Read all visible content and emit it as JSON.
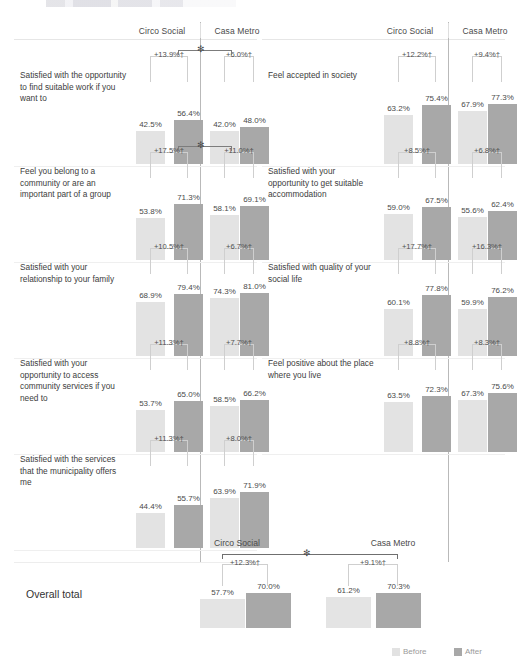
{
  "colors": {
    "before": "#e3e3e3",
    "after": "#a8a8a8",
    "separator": "#b9b9b9",
    "text": "#3d3d3d"
  },
  "legend": {
    "before_label": "Before",
    "after_label": "After"
  },
  "columns": {
    "left_group": "Circo Social",
    "right_group": "Casa Metro"
  },
  "total": {
    "label": "Overall total",
    "col1": "Circo Social",
    "col2": "Casa Metro",
    "marker": "✻"
  },
  "chart_data": {
    "type": "bar",
    "title": "",
    "xlabel": "",
    "ylabel": "",
    "ylim": [
      0,
      100
    ],
    "grid": false,
    "legend_position": "bottom-right",
    "series": [
      {
        "name": "Before",
        "color": "#e3e3e3"
      },
      {
        "name": "After",
        "color": "#a8a8a8"
      }
    ],
    "groups": [
      "Circo Social",
      "Casa Metro"
    ],
    "left_column": [
      {
        "category": "Satisfied with the opportunity to find suitable work if you want to",
        "circo": {
          "before": 42.5,
          "after": 56.4,
          "before_label": "42.5%",
          "after_label": "56.4%",
          "delta": "+13.9%†"
        },
        "casa": {
          "before": 42.0,
          "after": 48.0,
          "before_label": "42.0%",
          "after_label": "48.0%",
          "delta": "+6.0%†"
        },
        "group_compare": "✻"
      },
      {
        "category": "Feel you belong to a community or are an important part of a group",
        "circo": {
          "before": 53.8,
          "after": 71.3,
          "before_label": "53.8%",
          "after_label": "71.3%",
          "delta": "+17.5%†"
        },
        "casa": {
          "before": 58.1,
          "after": 69.1,
          "before_label": "58.1%",
          "after_label": "69.1%",
          "delta": "+11.0%†"
        },
        "group_compare": "✻"
      },
      {
        "category": "Satisfied with your relationship to your family",
        "circo": {
          "before": 68.9,
          "after": 79.4,
          "before_label": "68.9%",
          "after_label": "79.4%",
          "delta": "+10.5%†"
        },
        "casa": {
          "before": 74.3,
          "after": 81.0,
          "before_label": "74.3%",
          "after_label": "81.0%",
          "delta": "+6.7%†"
        },
        "group_compare": ""
      },
      {
        "category": "Satisfied with your opportunity to access community services if you need to",
        "circo": {
          "before": 53.7,
          "after": 65.0,
          "before_label": "53.7%",
          "after_label": "65.0%",
          "delta": "+11.3%†"
        },
        "casa": {
          "before": 58.5,
          "after": 66.2,
          "before_label": "58.5%",
          "after_label": "66.2%",
          "delta": "+7.7%†"
        },
        "group_compare": ""
      },
      {
        "category": "Satisfied with the services that the municipality offers me",
        "circo": {
          "before": 44.4,
          "after": 55.7,
          "before_label": "44.4%",
          "after_label": "55.7%",
          "delta": "+11.3%†"
        },
        "casa": {
          "before": 63.9,
          "after": 71.9,
          "before_label": "63.9%",
          "after_label": "71.9%",
          "delta": "+8.0%†"
        },
        "group_compare": ""
      }
    ],
    "right_column": [
      {
        "category": "Feel accepted in society",
        "circo": {
          "before": 63.2,
          "after": 75.4,
          "before_label": "63.2%",
          "after_label": "75.4%",
          "delta": "+12.2%†"
        },
        "casa": {
          "before": 67.9,
          "after": 77.3,
          "before_label": "67.9%",
          "after_label": "77.3%",
          "delta": "+9.4%†"
        },
        "group_compare": ""
      },
      {
        "category": "Satisfied with your opportunity to get suitable accommodation",
        "circo": {
          "before": 59.0,
          "after": 67.5,
          "before_label": "59.0%",
          "after_label": "67.5%",
          "delta": "+8.5%†"
        },
        "casa": {
          "before": 55.6,
          "after": 62.4,
          "before_label": "55.6%",
          "after_label": "62.4%",
          "delta": "+6.8%†"
        },
        "group_compare": ""
      },
      {
        "category": "Satisfied with quality of your social life",
        "circo": {
          "before": 60.1,
          "after": 77.8,
          "before_label": "60.1%",
          "after_label": "77.8%",
          "delta": "+17.7%†"
        },
        "casa": {
          "before": 59.9,
          "after": 76.2,
          "before_label": "59.9%",
          "after_label": "76.2%",
          "delta": "+16.3%†"
        },
        "group_compare": ""
      },
      {
        "category": "Feel positive about the place where you live",
        "circo": {
          "before": 63.5,
          "after": 72.3,
          "before_label": "63.5%",
          "after_label": "72.3%",
          "delta": "+8.8%†"
        },
        "casa": {
          "before": 67.3,
          "after": 75.6,
          "before_label": "67.3%",
          "after_label": "75.6%",
          "delta": "+8.3%†"
        },
        "group_compare": ""
      }
    ],
    "overall_total": {
      "label": "Overall total",
      "circo": {
        "before": 57.7,
        "after": 70.0,
        "before_label": "57.7%",
        "after_label": "70.0%",
        "delta": "+12.3%†"
      },
      "casa": {
        "before": 61.2,
        "after": 70.3,
        "before_label": "61.2%",
        "after_label": "70.3%",
        "delta": "+9.1%†"
      },
      "group_compare": "✻"
    }
  }
}
